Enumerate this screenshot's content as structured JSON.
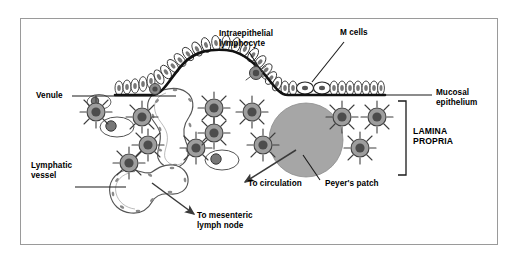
{
  "figure": {
    "border_color": "#9a9a9a",
    "background": "#ffffff",
    "ink_color": "#000000",
    "cell_fill": "#9b9b9b",
    "patch_fill": "#a3a3a3",
    "nucleus_fill": "#4a4a4a"
  },
  "labels": {
    "intraepithelial_lymphocyte": "Intraepithelial\nlymphocyte",
    "m_cells": "M cells",
    "mucosal_epithelium": "Mucosal\nepithelium",
    "lamina_propria": "LAMINA\nPROPRIA",
    "venule": "Venule",
    "lymphatic_vessel": "Lymphatic\nvessel",
    "to_circulation": "To circulation",
    "peyers_patch": "Peyer's patch",
    "to_mesenteric_lymph_node": "To mesenteric\nlymph node"
  },
  "structures": {
    "epithelium": {
      "name": "columnar epithelial cell layer",
      "cell_count": 42,
      "m_cell_count": 2
    },
    "peyers_patch": {
      "name": "Peyer's patch follicle",
      "cx": 306,
      "cy": 140,
      "r": 37
    },
    "dendritic_cells": {
      "name": "dendritic cells",
      "count": 12
    },
    "plasma_cells": {
      "name": "outlined oval plasma cells",
      "count": 3
    },
    "venule": {
      "name": "venule lumen outline"
    },
    "lymphatic_vessel": {
      "name": "lymphatic vessel lumen outline"
    }
  },
  "arrows": {
    "to_circulation": "arrow from Peyer's patch toward lower-left",
    "to_mesenteric_lymph_node": "arrow from lymphatic vessel toward lower-right"
  }
}
